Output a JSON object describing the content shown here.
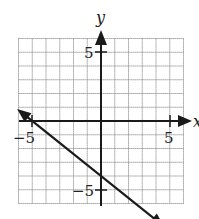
{
  "chart_data": {
    "type": "line",
    "title": "",
    "xlabel": "x",
    "ylabel": "y",
    "xlim": [
      -6,
      6
    ],
    "ylim": [
      -6,
      6
    ],
    "grid": true,
    "grid_step": 1,
    "tick_labels": {
      "x": [
        "-5",
        "5"
      ],
      "y": [
        "5",
        "-5"
      ]
    },
    "series": [
      {
        "name": "line",
        "equation": "y = -4/5 x - 4",
        "slope": -0.8,
        "intercept": -4,
        "points": [
          [
            -5,
            0
          ],
          [
            0,
            -4
          ]
        ],
        "arrows_both_ends": true,
        "x_range": [
          -6.1,
          4.6
        ]
      }
    ]
  },
  "labels": {
    "x_axis": "x",
    "y_axis": "y",
    "x_neg": "−5",
    "x_pos": "5",
    "y_pos": "5",
    "y_neg": "−5"
  },
  "colors": {
    "grid": "#8a8a8a",
    "axis": "#1a1a1a",
    "line": "#1a1a1a"
  }
}
